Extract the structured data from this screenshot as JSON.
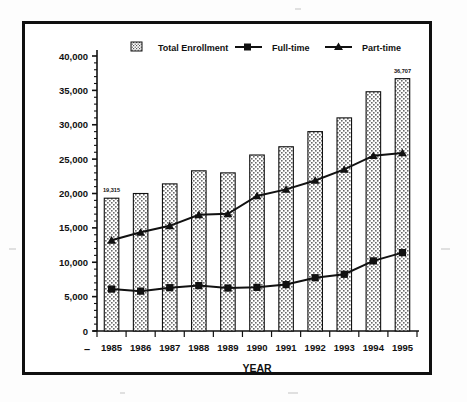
{
  "figure": {
    "background_color": "#ffffff",
    "frame_color": "#101010",
    "ink_color": "#111111"
  },
  "chart_data": {
    "type": "bar",
    "title": "",
    "subtitle": "",
    "xlabel": "YEAR",
    "ylabel": "",
    "categories": [
      "1985",
      "1986",
      "1987",
      "1988",
      "1989",
      "1990",
      "1991",
      "1992",
      "1993",
      "1994",
      "1995"
    ],
    "ylim": [
      0,
      40000
    ],
    "ytick_values": [
      0,
      5000,
      10000,
      15000,
      20000,
      25000,
      30000,
      35000,
      40000
    ],
    "ytick_labels": [
      "0",
      "5,000",
      "10,000",
      "15,000",
      "20,000",
      "25,000",
      "30,000",
      "35,000",
      "40,000"
    ],
    "minor_ticks": true,
    "grid": false,
    "legend_position": "top",
    "series": [
      {
        "name": "Total Enrollment",
        "type": "bar",
        "marker": "stippled-square",
        "values": [
          19315,
          20000,
          21400,
          23300,
          23000,
          25600,
          26800,
          29000,
          31000,
          34800,
          36707
        ]
      },
      {
        "name": "Full-time",
        "type": "line",
        "marker": "square",
        "values": [
          6100,
          5800,
          6300,
          6600,
          6250,
          6350,
          6750,
          7750,
          8250,
          10200,
          11400
        ]
      },
      {
        "name": "Part-time",
        "type": "line",
        "marker": "triangle",
        "values": [
          13200,
          14350,
          15300,
          16900,
          17050,
          19650,
          20600,
          21900,
          23500,
          25500,
          25900
        ]
      }
    ],
    "annotations": [
      {
        "label": "19,315",
        "category": "1985",
        "series": "Total Enrollment"
      },
      {
        "label": "36,707",
        "category": "1995",
        "series": "Total Enrollment"
      }
    ]
  },
  "legend": {
    "items": [
      {
        "label": "Total Enrollment",
        "marker": "stippled-swatch"
      },
      {
        "label": "Full-time",
        "marker": "line-square"
      },
      {
        "label": "Part-time",
        "marker": "line-triangle"
      }
    ]
  },
  "axes": {
    "x_title": "YEAR",
    "zero_label": "0",
    "dash_marker": "–"
  }
}
